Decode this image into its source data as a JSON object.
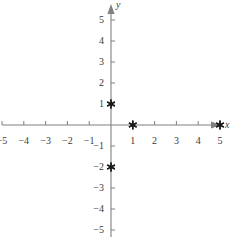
{
  "figure": {
    "kind": "coordinate-plane",
    "background_color": "#ffffff",
    "axis_color": "#808080",
    "label_color": "#3a3a3a",
    "marker_color": "#1a1a1a",
    "x_axis_label": "x",
    "y_axis_label": "y"
  },
  "chart_data": {
    "type": "scatter",
    "title": "",
    "xlabel": "x",
    "ylabel": "y",
    "xlim": [
      -5.6,
      5.6
    ],
    "ylim": [
      -5.6,
      5.6
    ],
    "grid": false,
    "legend": null,
    "x_ticks": [
      -5,
      -4,
      -3,
      -2,
      -1,
      1,
      2,
      3,
      4,
      5
    ],
    "y_ticks": [
      5,
      4,
      3,
      2,
      1,
      -1,
      -2,
      -3,
      -4,
      -5
    ],
    "x_tick_labels": [
      "−5",
      "−4",
      "−3",
      "−2",
      "−1",
      "1",
      "2",
      "3",
      "4",
      "5"
    ],
    "y_tick_labels": [
      "5",
      "4",
      "3",
      "2",
      "1",
      "−1",
      "−2",
      "−3",
      "−4",
      "−5"
    ],
    "marker_style": "six-point-asterisk",
    "points": [
      {
        "x": 0,
        "y": 1,
        "label": "(0, 1)"
      },
      {
        "x": 1,
        "y": 0,
        "label": "(1, 0)"
      },
      {
        "x": 5,
        "y": 0,
        "label": "(5, 0)"
      },
      {
        "x": 0,
        "y": -2,
        "label": "(0, −2)"
      }
    ]
  },
  "geometry": {
    "origin_x": 111,
    "origin_y": 125,
    "unit_x": 21.8,
    "unit_y": 21.0,
    "tick_len": 4,
    "x_label_offset": 11,
    "y_label_offset": 7
  }
}
